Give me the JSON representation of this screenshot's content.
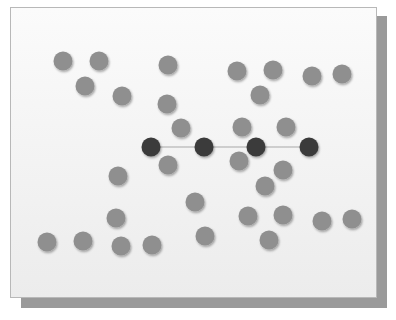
{
  "diagram": {
    "colors": {
      "node_light": "#8f8f8f",
      "node_dark": "#3a3a3a",
      "edge": "#a8a8a8"
    },
    "light_nodes": [
      [
        63,
        61
      ],
      [
        99,
        61
      ],
      [
        168,
        65
      ],
      [
        237,
        71
      ],
      [
        273,
        70
      ],
      [
        312,
        76
      ],
      [
        342,
        74
      ],
      [
        85,
        86
      ],
      [
        122,
        96
      ],
      [
        260,
        95
      ],
      [
        167,
        104
      ],
      [
        181,
        128
      ],
      [
        242,
        127
      ],
      [
        286,
        127
      ],
      [
        168,
        165
      ],
      [
        239,
        161
      ],
      [
        283,
        170
      ],
      [
        118,
        176
      ],
      [
        265,
        186
      ],
      [
        195,
        202
      ],
      [
        116,
        218
      ],
      [
        248,
        216
      ],
      [
        283,
        215
      ],
      [
        322,
        221
      ],
      [
        352,
        219
      ],
      [
        47,
        242
      ],
      [
        83,
        241
      ],
      [
        121,
        246
      ],
      [
        152,
        245
      ],
      [
        205,
        236
      ],
      [
        269,
        240
      ]
    ],
    "dark_nodes": [
      [
        151,
        147
      ],
      [
        204,
        147
      ],
      [
        256,
        147
      ],
      [
        309,
        147
      ]
    ]
  }
}
